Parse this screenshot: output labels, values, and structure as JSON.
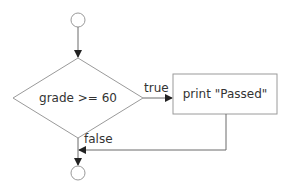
{
  "diagram": {
    "type": "flowchart",
    "nodes": {
      "start": {
        "shape": "circle"
      },
      "decision": {
        "shape": "diamond",
        "label": "grade >= 60"
      },
      "action": {
        "shape": "rectangle",
        "label": "print \"Passed\""
      },
      "end": {
        "shape": "circle"
      }
    },
    "edges": {
      "true_label": "true",
      "false_label": "false"
    },
    "colors": {
      "shape_stroke": "#9a9a9a",
      "line": "#6a6a6a",
      "text": "#333333",
      "background": "#ffffff"
    }
  }
}
